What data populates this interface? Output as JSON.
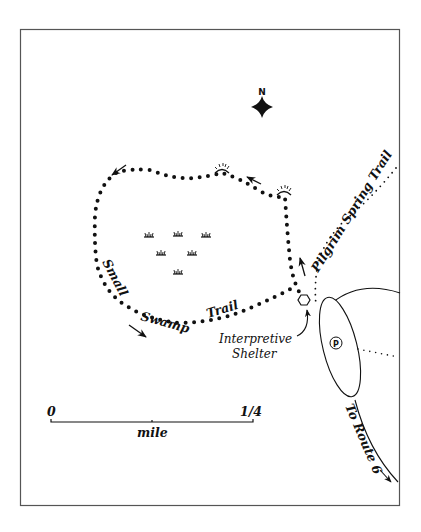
{
  "map": {
    "title": "",
    "colors": {
      "ink": "#111111",
      "frame": "#555555",
      "background": "#ffffff"
    },
    "compass": {
      "label": "N"
    },
    "trails": [
      {
        "name": "Small Swamp Trail",
        "words": [
          "Small",
          "Swamp",
          "Trail"
        ],
        "style": "dotted-bold",
        "type": "loop"
      },
      {
        "name": "Pilgrim Spring Trail",
        "style": "dotted-fine"
      }
    ],
    "features": {
      "shelter_label_line1": "Interpretive",
      "shelter_label_line2": "Shelter",
      "parking_symbol": "P",
      "road_label": "To Route 6",
      "marsh_symbol_count": 6,
      "viewpoint_symbol_count": 2,
      "direction_arrow_count": 4
    },
    "scale_bar": {
      "start_label": "0",
      "end_label": "1/4",
      "unit_label": "mile"
    }
  }
}
